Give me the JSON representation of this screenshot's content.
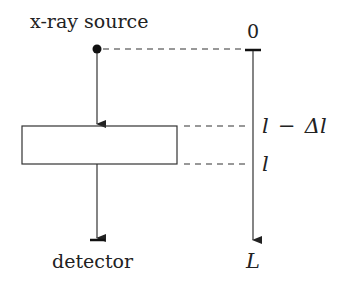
{
  "diagram": {
    "source_label": "x-ray source",
    "detector_label": "detector",
    "axis": {
      "top_label": "0",
      "mark_upper_label": "l − Δl",
      "mark_upper_l": "l",
      "mark_upper_minus": "−",
      "mark_upper_delta": "Δl",
      "mark_lower_label": "l",
      "end_label": "L"
    },
    "colors": {
      "stroke": "#333333",
      "text": "#222222",
      "background": "#ffffff"
    }
  }
}
